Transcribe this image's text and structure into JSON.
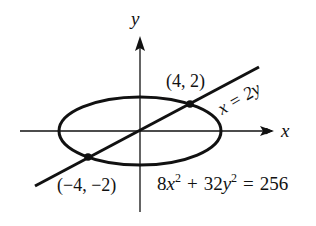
{
  "diagram": {
    "type": "ellipse-line-intersection",
    "axes": {
      "x_label": "x",
      "y_label": "y"
    },
    "curve": {
      "equation_parts": {
        "c1": "8",
        "v1": "x",
        "e1": "2",
        "op": "+",
        "c2": "32",
        "v2": "y",
        "e2": "2",
        "eq": "=",
        "rhs": "256"
      },
      "equation": "8x^2 + 32y^2 = 256"
    },
    "line": {
      "label": "x = 2y",
      "equation": "x = 2y"
    },
    "points": [
      {
        "label": "(4, 2)",
        "x": 4,
        "y": 2
      },
      {
        "label": "(−4, −2)",
        "x": -4,
        "y": -2
      }
    ],
    "colors": {
      "stroke": "#111111",
      "background": "#ffffff"
    }
  }
}
